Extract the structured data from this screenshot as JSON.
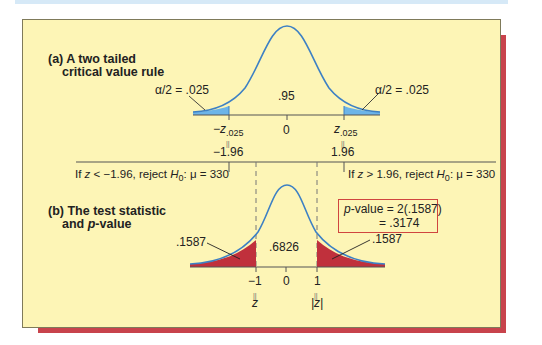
{
  "figure": {
    "panel_a": {
      "title_line1": "(a) A two tailed",
      "title_line2": "critical value rule",
      "left_tail_label": "α/2 = .025",
      "right_tail_label": "α/2 = .025",
      "center_label": ".95",
      "tick_left_symbol": "−z",
      "tick_left_sub": ".025",
      "tick_center": "0",
      "tick_right_symbol": "z",
      "tick_right_sub": ".025",
      "equals_glyph": "||",
      "tick_left_value": "−1.96",
      "tick_right_value": "1.96",
      "tail_color": "#6cb4e8",
      "curve_color": "#3d80c4"
    },
    "rules": {
      "left_rule_pre": "If ",
      "left_rule_var": "z",
      "left_rule_mid": " < −1.96, reject ",
      "left_rule_h": "H",
      "left_rule_h_sub": "0",
      "left_rule_post": ": μ = 330",
      "right_rule_pre": "If ",
      "right_rule_var": "z",
      "right_rule_mid": " > 1.96, reject ",
      "right_rule_h": "H",
      "right_rule_h_sub": "0",
      "right_rule_post": ": μ = 330"
    },
    "panel_b": {
      "title_line1": "(b) The test statistic",
      "title_line2_pre": "and ",
      "title_line2_italic": "p",
      "title_line2_post": "-value",
      "left_tail_label": ".1587",
      "right_tail_label": ".1587",
      "center_label": ".6826",
      "tick_left": "−1",
      "tick_center": "0",
      "tick_right": "1",
      "equals_glyph": "||",
      "tick_left_var": "z",
      "tick_right_var": "|z|",
      "pvalue_line1_italic": "p",
      "pvalue_line1_rest": "-value = 2(.1587)",
      "pvalue_line2": "= .3174",
      "tail_color": "#c0303c",
      "curve_color": "#3d80c4",
      "box_color": "#d0453f"
    },
    "colors": {
      "panel_background": "#fdf5b6",
      "shadow": "#c8434c",
      "top_band": "#d6e9f7"
    }
  }
}
